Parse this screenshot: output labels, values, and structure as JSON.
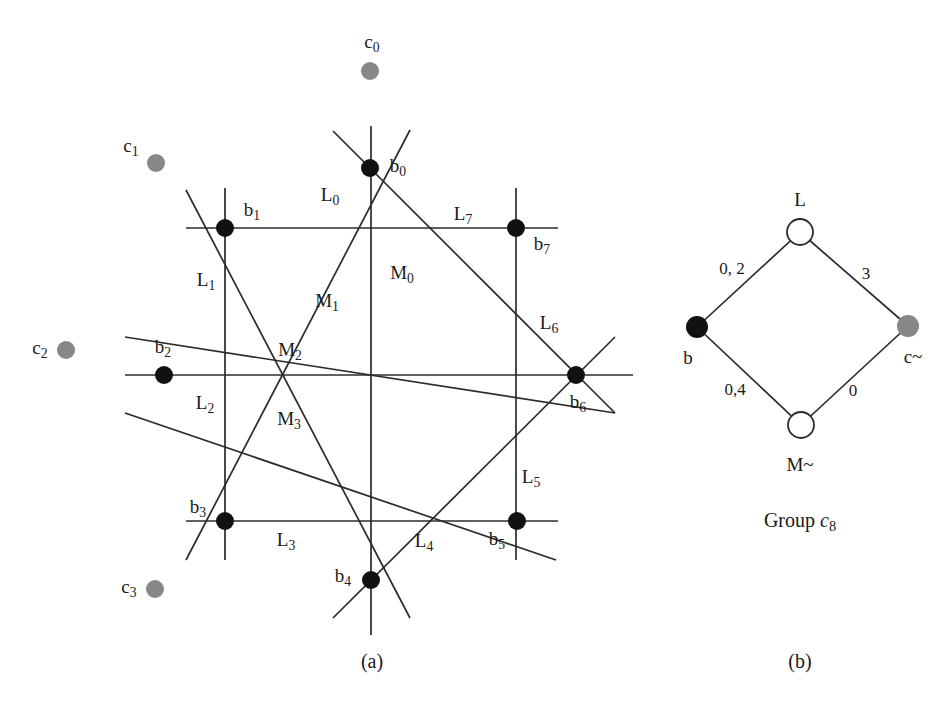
{
  "figure": {
    "subfigure_labels": [
      {
        "text": "(a)",
        "x": 372,
        "y": 661
      },
      {
        "text": "(b)",
        "x": 800,
        "y": 661
      }
    ]
  },
  "colors": {
    "line": "#2b2b2b",
    "black_node": "#111111",
    "gray_node": "#878787",
    "background": "#ffffff",
    "text": "#1a1a1a"
  },
  "panel_a": {
    "center": {
      "x": 372,
      "y": 376
    },
    "black_nodes": [
      {
        "name": "b0",
        "base": "b",
        "sub": "0",
        "x": 370,
        "y": 168,
        "r": 9,
        "label_x": 398,
        "label_y": 167
      },
      {
        "name": "b1",
        "base": "b",
        "sub": "1",
        "x": 225,
        "y": 228,
        "r": 9,
        "label_x": 252,
        "label_y": 211
      },
      {
        "name": "b2",
        "base": "b",
        "sub": "2",
        "x": 164,
        "y": 375,
        "r": 9,
        "label_x": 163,
        "label_y": 348
      },
      {
        "name": "b3",
        "base": "b",
        "sub": "3",
        "x": 225,
        "y": 521,
        "r": 9,
        "label_x": 198,
        "label_y": 508
      },
      {
        "name": "b4",
        "base": "b",
        "sub": "4",
        "x": 371,
        "y": 580,
        "r": 9,
        "label_x": 343,
        "label_y": 577
      },
      {
        "name": "b5",
        "base": "b",
        "sub": "5",
        "x": 517,
        "y": 521,
        "r": 9,
        "label_x": 497,
        "label_y": 540
      },
      {
        "name": "b6",
        "base": "b",
        "sub": "6",
        "x": 576,
        "y": 375,
        "r": 9,
        "label_x": 578,
        "label_y": 403
      },
      {
        "name": "b7",
        "base": "b",
        "sub": "7",
        "x": 516,
        "y": 228,
        "r": 9,
        "label_x": 542,
        "label_y": 245
      }
    ],
    "gray_nodes": [
      {
        "name": "c0",
        "base": "c",
        "sub": "0",
        "x": 370,
        "y": 71,
        "r": 9,
        "label_x": 372,
        "label_y": 43
      },
      {
        "name": "c1",
        "base": "c",
        "sub": "1",
        "x": 156,
        "y": 163,
        "r": 9,
        "label_x": 131,
        "label_y": 147
      },
      {
        "name": "c2",
        "base": "c",
        "sub": "2",
        "x": 66,
        "y": 350,
        "r": 9,
        "label_x": 40,
        "label_y": 349
      },
      {
        "name": "c3",
        "base": "c",
        "sub": "3",
        "x": 155,
        "y": 589,
        "r": 9,
        "label_x": 129,
        "label_y": 588
      }
    ],
    "line_labels": [
      {
        "name": "L0",
        "base": "L",
        "sub": "0",
        "x": 330,
        "y": 196
      },
      {
        "name": "L1",
        "base": "L",
        "sub": "1",
        "x": 206,
        "y": 281
      },
      {
        "name": "L2",
        "base": "L",
        "sub": "2",
        "x": 205,
        "y": 404
      },
      {
        "name": "L3",
        "base": "L",
        "sub": "3",
        "x": 286,
        "y": 541
      },
      {
        "name": "L4",
        "base": "L",
        "sub": "4",
        "x": 424,
        "y": 542
      },
      {
        "name": "L5",
        "base": "L",
        "sub": "5",
        "x": 531,
        "y": 478
      },
      {
        "name": "L6",
        "base": "L",
        "sub": "6",
        "x": 549,
        "y": 324
      },
      {
        "name": "L7",
        "base": "L",
        "sub": "7",
        "x": 463,
        "y": 215
      },
      {
        "name": "M0",
        "base": "M",
        "sub": "0",
        "x": 402,
        "y": 274
      },
      {
        "name": "M1",
        "base": "M",
        "sub": "1",
        "x": 327,
        "y": 302
      },
      {
        "name": "M2",
        "base": "M",
        "sub": "2",
        "x": 290,
        "y": 351
      },
      {
        "name": "M3",
        "base": "M",
        "sub": "3",
        "x": 289,
        "y": 420
      }
    ],
    "lines": {
      "horizontal": [
        {
          "name": "row-b1-b7",
          "x1": 186,
          "y1": 228,
          "x2": 558,
          "y2": 228
        },
        {
          "name": "row-b2-b6",
          "x1": 125,
          "y1": 375,
          "x2": 633,
          "y2": 375
        },
        {
          "name": "row-b3-b5",
          "x1": 186,
          "y1": 521,
          "x2": 558,
          "y2": 521
        }
      ],
      "vertical": [
        {
          "name": "col-b1-b3",
          "x1": 225,
          "y1": 188,
          "x2": 225,
          "y2": 560
        },
        {
          "name": "col-b0-b4",
          "x1": 371,
          "y1": 126,
          "x2": 371,
          "y2": 635
        },
        {
          "name": "col-b7-b5",
          "x1": 516,
          "y1": 188,
          "x2": 516,
          "y2": 560
        }
      ],
      "diagonal_down_right": [
        {
          "name": "diag-b1-b4",
          "x1": 186,
          "y1": 190,
          "x2": 410,
          "y2": 618
        },
        {
          "name": "diag-b0-b6",
          "x1": 333,
          "y1": 131,
          "x2": 615,
          "y2": 413
        },
        {
          "name": "diag-b2-b6-outer",
          "x1": 125,
          "y1": 337,
          "x2": 615,
          "y2": 413
        }
      ],
      "diagonal_up_right": [
        {
          "name": "diag-b3-b0",
          "x1": 186,
          "y1": 560,
          "x2": 410,
          "y2": 130
        },
        {
          "name": "diag-b4-b7",
          "x1": 333,
          "y1": 618,
          "x2": 615,
          "y2": 337
        },
        {
          "name": "diag-b2-b5",
          "x1": 125,
          "y1": 413,
          "x2": 556,
          "y2": 560
        }
      ]
    }
  },
  "panel_b": {
    "nodes": [
      {
        "name": "node-L",
        "style": "open",
        "x": 800,
        "y": 232,
        "r": 13,
        "label": "L",
        "label_x": 800,
        "label_y": 199
      },
      {
        "name": "node-b",
        "style": "filled-black",
        "x": 697,
        "y": 327,
        "r": 11,
        "label": "b",
        "label_x": 688,
        "label_y": 357
      },
      {
        "name": "node-c-tilde",
        "style": "filled-gray",
        "x": 908,
        "y": 326,
        "r": 11,
        "label": "c~",
        "label_x": 913,
        "label_y": 356
      },
      {
        "name": "node-M-tilde",
        "style": "open",
        "x": 801,
        "y": 425,
        "r": 13,
        "label": "M~",
        "label_x": 800,
        "label_y": 464
      }
    ],
    "edges": [
      {
        "name": "edge-b-L",
        "x1": 697,
        "y1": 327,
        "x2": 800,
        "y2": 232,
        "label": "0, 2",
        "label_x": 732,
        "label_y": 268
      },
      {
        "name": "edge-L-c",
        "x1": 800,
        "y1": 232,
        "x2": 908,
        "y2": 326,
        "label": "3",
        "label_x": 866,
        "label_y": 273
      },
      {
        "name": "edge-b-M",
        "x1": 697,
        "y1": 327,
        "x2": 801,
        "y2": 425,
        "label": "0,4",
        "label_x": 735,
        "label_y": 389
      },
      {
        "name": "edge-M-c",
        "x1": 801,
        "y1": 425,
        "x2": 908,
        "y2": 326,
        "label": "0",
        "label_x": 853,
        "label_y": 390
      }
    ],
    "caption": {
      "text_prefix": "Group ",
      "symbol": "c",
      "symbol_sub": "8",
      "x": 800,
      "y": 522
    }
  }
}
